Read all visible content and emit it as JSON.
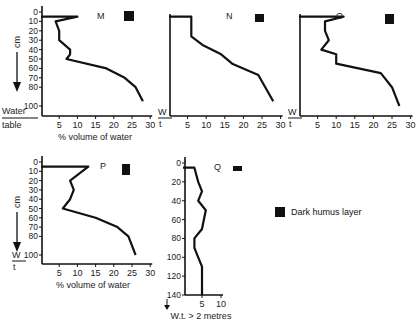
{
  "legend": {
    "label": "Dark humus layer",
    "color": "#111111"
  },
  "labels": {
    "y_unit": "cm",
    "x_title": "% volume of water",
    "water_table": "Water table",
    "wt_short_top": "W",
    "wt_short_bottom": "t",
    "q_note": "W.t. > 2 metres"
  },
  "chart_data": [
    {
      "type": "line",
      "title": "M",
      "xlabel": "% volume of water",
      "ylabel": "cm",
      "xlim": [
        0,
        30
      ],
      "ylim": [
        0,
        100
      ],
      "x_ticks": [
        5,
        10,
        15,
        20,
        25,
        30
      ],
      "y_ticks": [
        0,
        10,
        20,
        30,
        40,
        50,
        60,
        70,
        80,
        100
      ],
      "humus_layer": true,
      "points": [
        [
          0,
          5
        ],
        [
          10,
          5
        ],
        [
          4,
          10
        ],
        [
          5,
          20
        ],
        [
          5,
          30
        ],
        [
          8,
          40
        ],
        [
          8,
          45
        ],
        [
          7,
          50
        ],
        [
          18,
          60
        ],
        [
          23,
          70
        ],
        [
          26,
          80
        ],
        [
          28,
          95
        ]
      ]
    },
    {
      "type": "line",
      "title": "N",
      "xlabel": "% volume of water",
      "xlim": [
        0,
        30
      ],
      "x_ticks": [
        5,
        10,
        15,
        20,
        25,
        30
      ],
      "humus_layer": true,
      "points": [
        [
          0,
          5
        ],
        [
          6,
          5
        ],
        [
          6,
          10
        ],
        [
          6,
          20
        ],
        [
          6,
          26
        ],
        [
          9,
          35
        ],
        [
          14,
          45
        ],
        [
          17,
          55
        ],
        [
          24,
          67
        ],
        [
          28,
          95
        ]
      ]
    },
    {
      "type": "line",
      "title": "O",
      "xlabel": "% volume of water",
      "xlim": [
        0,
        30
      ],
      "x_ticks": [
        5,
        10,
        15,
        20,
        25,
        30
      ],
      "humus_layer": true,
      "points": [
        [
          0,
          5
        ],
        [
          12,
          5
        ],
        [
          7,
          10
        ],
        [
          7,
          20
        ],
        [
          8,
          30
        ],
        [
          6,
          40
        ],
        [
          10,
          45
        ],
        [
          10,
          55
        ],
        [
          22,
          65
        ],
        [
          25,
          80
        ],
        [
          26,
          90
        ],
        [
          27,
          100
        ]
      ]
    },
    {
      "type": "line",
      "title": "P",
      "xlabel": "% volume of water",
      "ylabel": "cm",
      "xlim": [
        0,
        30
      ],
      "ylim": [
        0,
        100
      ],
      "x_ticks": [
        5,
        10,
        15,
        20,
        25,
        30
      ],
      "y_ticks": [
        0,
        10,
        20,
        30,
        40,
        50,
        60,
        70,
        80,
        100
      ],
      "humus_layer": true,
      "points": [
        [
          0,
          5
        ],
        [
          13,
          5
        ],
        [
          8,
          20
        ],
        [
          9,
          30
        ],
        [
          8,
          40
        ],
        [
          6,
          50
        ],
        [
          15,
          60
        ],
        [
          21,
          70
        ],
        [
          24,
          80
        ],
        [
          25,
          90
        ],
        [
          26,
          100
        ]
      ]
    },
    {
      "type": "line",
      "title": "Q",
      "xlabel": "W.t. > 2 metres",
      "ylabel": "cm",
      "xlim": [
        0,
        10
      ],
      "ylim": [
        0,
        140
      ],
      "x_ticks": [
        5,
        10
      ],
      "y_ticks": [
        0,
        20,
        40,
        60,
        80,
        100,
        120,
        140
      ],
      "humus_layer": true,
      "points": [
        [
          0,
          5
        ],
        [
          3,
          5
        ],
        [
          4,
          20
        ],
        [
          5,
          30
        ],
        [
          4,
          40
        ],
        [
          6,
          50
        ],
        [
          5,
          70
        ],
        [
          3,
          80
        ],
        [
          3,
          90
        ],
        [
          4,
          100
        ],
        [
          5,
          110
        ],
        [
          5,
          140
        ]
      ]
    }
  ]
}
